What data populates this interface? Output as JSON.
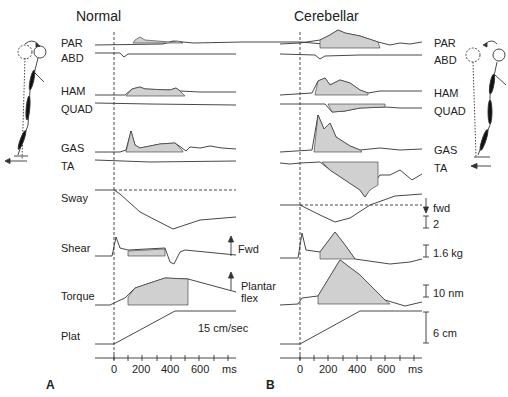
{
  "panels": {
    "A": {
      "letter": "A",
      "title": "Normal"
    },
    "B": {
      "letter": "B",
      "title": "Cerebellar"
    }
  },
  "traces": {
    "emg": [
      "PAR",
      "ABD",
      "HAM",
      "QUAD",
      "GAS",
      "TA"
    ],
    "mechanical": [
      "Sway",
      "Shear",
      "Torque",
      "Plat"
    ]
  },
  "annotations": {
    "fwd_arrow": "Fwd",
    "plantar_flex_line1": "Plantar",
    "plantar_flex_line2": "flex",
    "plat_speed": "15 cm/sec",
    "sway_fwd": "fwd"
  },
  "scale_bars": {
    "sway": "2",
    "shear": "1.6 kg",
    "torque": "10 nm",
    "plat": "6 cm"
  },
  "time_axis": {
    "ticks": [
      "0",
      "200",
      "400",
      "600"
    ],
    "unit": "ms"
  },
  "colors": {
    "trace": "#333333",
    "shade": "#d0d0d0"
  }
}
